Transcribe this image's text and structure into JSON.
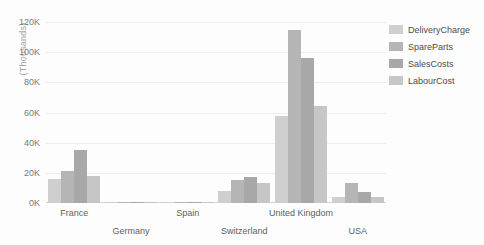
{
  "chart_data": {
    "type": "bar",
    "title": "",
    "subtitle": "",
    "xlabel": "",
    "ylabel": "(Thousands)",
    "categories": [
      "France",
      "Germany",
      "Spain",
      "Switzerland",
      "United Kingdom",
      "USA"
    ],
    "series": [
      {
        "name": "DeliveryCharge",
        "color": "#cfcfcf",
        "values": [
          16,
          0.3,
          0.3,
          8,
          58,
          4
        ]
      },
      {
        "name": "SpareParts",
        "color": "#b5b5b5",
        "values": [
          21,
          0.3,
          0.3,
          15,
          115,
          13
        ]
      },
      {
        "name": "SalesCosts",
        "color": "#a8a8a8",
        "values": [
          35,
          0.4,
          0.5,
          17,
          96,
          7
        ]
      },
      {
        "name": "LabourCost",
        "color": "#c6c6c6",
        "values": [
          18,
          0.3,
          0.6,
          13,
          64,
          4
        ]
      }
    ],
    "ylim": [
      0,
      120
    ],
    "y_ticks": [
      0,
      20,
      40,
      60,
      80,
      100,
      120
    ],
    "y_tick_labels": [
      "0K",
      "20K",
      "40K",
      "60K",
      "80K",
      "100K",
      "120K"
    ],
    "grid": true,
    "grid_axis": "y",
    "legend_position": "right",
    "orientation": "vertical",
    "grouping": "grouped",
    "x_label_rows": [
      0,
      1,
      0,
      1,
      0,
      1
    ]
  },
  "legend": {
    "items": [
      {
        "label": "DeliveryCharge",
        "color": "#cfcfcf"
      },
      {
        "label": "SpareParts",
        "color": "#b5b5b5"
      },
      {
        "label": "SalesCosts",
        "color": "#a8a8a8"
      },
      {
        "label": "LabourCost",
        "color": "#c6c6c6"
      }
    ]
  },
  "colors": {
    "background": "#fdfdfd",
    "gridline": "#eeeeee",
    "axis": "#d4d4d4",
    "tick_text": "#7a7a7a",
    "axis_title": "#a6a6a6"
  }
}
